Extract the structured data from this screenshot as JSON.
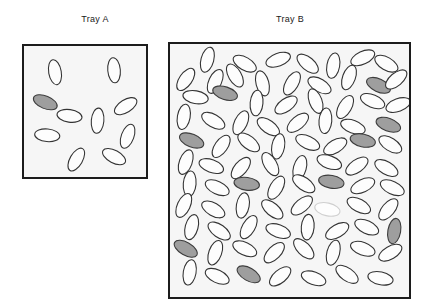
{
  "figure": {
    "type": "numerosity-comparison-stimulus",
    "background_color": "#ffffff",
    "panels": [
      {
        "id": "tray-a",
        "label": "Tray A",
        "label_position": "above-center",
        "box": {
          "x": 22,
          "y": 44,
          "width": 126,
          "height": 135
        },
        "fill_color": "#f6f6f6",
        "border_color": "#1c1c1c",
        "border_width": 2,
        "total_count": 10,
        "shaded_count": 1,
        "unshaded_count": 9,
        "shape": "ellipse"
      },
      {
        "id": "tray-b",
        "label": "Tray B",
        "label_position": "above-center",
        "box": {
          "x": 168,
          "y": 42,
          "width": 243,
          "height": 257
        },
        "fill_color": "#f6f6f6",
        "border_color": "#1c1c1c",
        "border_width": 2,
        "total_count": 85,
        "shaded_count": 10,
        "unshaded_count": 75,
        "shape": "ellipse"
      }
    ],
    "colors": {
      "shaded_fill": "#9e9e9e",
      "shaded_stroke": "#3c3c3c",
      "unshaded_fill": "#fdfdfd",
      "unshaded_stroke": "#333333",
      "faint_stroke": "#cfcfcf",
      "tray_fill": "#f6f6f6",
      "tray_border": "#1c1c1c",
      "label_text": "#1a1a1a"
    },
    "ellipse_style": {
      "rx": 13,
      "ry": 6.5,
      "stroke_width": 1.1
    }
  },
  "tray_a_ellipses": [
    {
      "cx": 32,
      "cy": 27,
      "rot": 80,
      "shade": "white"
    },
    {
      "cx": 93,
      "cy": 25,
      "rot": 85,
      "shade": "white"
    },
    {
      "cx": 22,
      "cy": 58,
      "rot": 22,
      "shade": "gray"
    },
    {
      "cx": 47,
      "cy": 72,
      "rot": 8,
      "shade": "white"
    },
    {
      "cx": 76,
      "cy": 77,
      "rot": 95,
      "shade": "white"
    },
    {
      "cx": 105,
      "cy": 62,
      "rot": 148,
      "shade": "white"
    },
    {
      "cx": 107,
      "cy": 93,
      "rot": 110,
      "shade": "white"
    },
    {
      "cx": 24,
      "cy": 92,
      "rot": 5,
      "shade": "white"
    },
    {
      "cx": 54,
      "cy": 117,
      "rot": 120,
      "shade": "white"
    },
    {
      "cx": 93,
      "cy": 114,
      "rot": 28,
      "shade": "white"
    }
  ],
  "tray_b_ellipses": [
    {
      "cx": 38,
      "cy": 16,
      "rot": 105,
      "shade": "white"
    },
    {
      "cx": 76,
      "cy": 20,
      "rot": 30,
      "shade": "white"
    },
    {
      "cx": 110,
      "cy": 16,
      "rot": 160,
      "shade": "white"
    },
    {
      "cx": 140,
      "cy": 20,
      "rot": 40,
      "shade": "white"
    },
    {
      "cx": 166,
      "cy": 22,
      "rot": 100,
      "shade": "white"
    },
    {
      "cx": 196,
      "cy": 14,
      "rot": 155,
      "shade": "white"
    },
    {
      "cx": 220,
      "cy": 20,
      "rot": 30,
      "shade": "white"
    },
    {
      "cx": 16,
      "cy": 36,
      "rot": 125,
      "shade": "white"
    },
    {
      "cx": 46,
      "cy": 38,
      "rot": 115,
      "shade": "white"
    },
    {
      "cx": 66,
      "cy": 32,
      "rot": 60,
      "shade": "white"
    },
    {
      "cx": 94,
      "cy": 40,
      "rot": 75,
      "shade": "white"
    },
    {
      "cx": 124,
      "cy": 40,
      "rot": 120,
      "shade": "white"
    },
    {
      "cx": 152,
      "cy": 42,
      "rot": 30,
      "shade": "white"
    },
    {
      "cx": 182,
      "cy": 34,
      "rot": 110,
      "shade": "white"
    },
    {
      "cx": 212,
      "cy": 42,
      "rot": 25,
      "shade": "gray"
    },
    {
      "cx": 230,
      "cy": 36,
      "rot": 140,
      "shade": "white"
    },
    {
      "cx": 26,
      "cy": 54,
      "rot": 10,
      "shade": "white"
    },
    {
      "cx": 56,
      "cy": 50,
      "rot": 18,
      "shade": "gray"
    },
    {
      "cx": 88,
      "cy": 60,
      "rot": 95,
      "shade": "white"
    },
    {
      "cx": 118,
      "cy": 62,
      "rot": 145,
      "shade": "white"
    },
    {
      "cx": 148,
      "cy": 58,
      "rot": 70,
      "shade": "white"
    },
    {
      "cx": 178,
      "cy": 64,
      "rot": 120,
      "shade": "white"
    },
    {
      "cx": 206,
      "cy": 58,
      "rot": 22,
      "shade": "white"
    },
    {
      "cx": 232,
      "cy": 62,
      "rot": 160,
      "shade": "white"
    },
    {
      "cx": 14,
      "cy": 74,
      "rot": 100,
      "shade": "white"
    },
    {
      "cx": 44,
      "cy": 78,
      "rot": 30,
      "shade": "white"
    },
    {
      "cx": 72,
      "cy": 80,
      "rot": 115,
      "shade": "white"
    },
    {
      "cx": 100,
      "cy": 84,
      "rot": 35,
      "shade": "white"
    },
    {
      "cx": 130,
      "cy": 80,
      "rot": 140,
      "shade": "white"
    },
    {
      "cx": 158,
      "cy": 78,
      "rot": 95,
      "shade": "white"
    },
    {
      "cx": 186,
      "cy": 84,
      "rot": 20,
      "shade": "white"
    },
    {
      "cx": 222,
      "cy": 82,
      "rot": 20,
      "shade": "gray"
    },
    {
      "cx": 22,
      "cy": 98,
      "rot": 22,
      "shade": "gray"
    },
    {
      "cx": 52,
      "cy": 104,
      "rot": 125,
      "shade": "white"
    },
    {
      "cx": 80,
      "cy": 100,
      "rot": 38,
      "shade": "white"
    },
    {
      "cx": 110,
      "cy": 104,
      "rot": 100,
      "shade": "white"
    },
    {
      "cx": 140,
      "cy": 100,
      "rot": 25,
      "shade": "white"
    },
    {
      "cx": 168,
      "cy": 104,
      "rot": 150,
      "shade": "white"
    },
    {
      "cx": 196,
      "cy": 98,
      "rot": 12,
      "shade": "gray"
    },
    {
      "cx": 224,
      "cy": 102,
      "rot": 32,
      "shade": "white"
    },
    {
      "cx": 16,
      "cy": 120,
      "rot": 110,
      "shade": "white"
    },
    {
      "cx": 42,
      "cy": 124,
      "rot": 20,
      "shade": "white"
    },
    {
      "cx": 72,
      "cy": 126,
      "rot": 130,
      "shade": "white"
    },
    {
      "cx": 102,
      "cy": 122,
      "rot": 60,
      "shade": "white"
    },
    {
      "cx": 132,
      "cy": 126,
      "rot": 105,
      "shade": "white"
    },
    {
      "cx": 162,
      "cy": 120,
      "rot": 20,
      "shade": "white"
    },
    {
      "cx": 190,
      "cy": 124,
      "rot": 145,
      "shade": "white"
    },
    {
      "cx": 220,
      "cy": 126,
      "rot": 30,
      "shade": "white"
    },
    {
      "cx": 20,
      "cy": 142,
      "rot": 95,
      "shade": "white"
    },
    {
      "cx": 48,
      "cy": 146,
      "rot": 25,
      "shade": "white"
    },
    {
      "cx": 78,
      "cy": 142,
      "rot": 8,
      "shade": "gray"
    },
    {
      "cx": 108,
      "cy": 146,
      "rot": 120,
      "shade": "white"
    },
    {
      "cx": 136,
      "cy": 142,
      "rot": 35,
      "shade": "white"
    },
    {
      "cx": 164,
      "cy": 140,
      "rot": 10,
      "shade": "gray"
    },
    {
      "cx": 196,
      "cy": 144,
      "rot": 155,
      "shade": "white"
    },
    {
      "cx": 226,
      "cy": 146,
      "rot": 25,
      "shade": "white"
    },
    {
      "cx": 14,
      "cy": 164,
      "rot": 115,
      "shade": "white"
    },
    {
      "cx": 44,
      "cy": 168,
      "rot": 30,
      "shade": "white"
    },
    {
      "cx": 74,
      "cy": 164,
      "rot": 100,
      "shade": "white"
    },
    {
      "cx": 104,
      "cy": 168,
      "rot": 40,
      "shade": "white"
    },
    {
      "cx": 134,
      "cy": 164,
      "rot": 140,
      "shade": "white"
    },
    {
      "cx": 160,
      "cy": 168,
      "rot": 12,
      "shade": "faint"
    },
    {
      "cx": 192,
      "cy": 164,
      "rot": 28,
      "shade": "white"
    },
    {
      "cx": 222,
      "cy": 168,
      "rot": 130,
      "shade": "white"
    },
    {
      "cx": 22,
      "cy": 186,
      "rot": 105,
      "shade": "white"
    },
    {
      "cx": 50,
      "cy": 190,
      "rot": 35,
      "shade": "white"
    },
    {
      "cx": 80,
      "cy": 186,
      "rot": 120,
      "shade": "white"
    },
    {
      "cx": 110,
      "cy": 190,
      "rot": 20,
      "shade": "white"
    },
    {
      "cx": 140,
      "cy": 186,
      "rot": 95,
      "shade": "white"
    },
    {
      "cx": 170,
      "cy": 190,
      "rot": 150,
      "shade": "white"
    },
    {
      "cx": 200,
      "cy": 186,
      "rot": 25,
      "shade": "white"
    },
    {
      "cx": 228,
      "cy": 190,
      "rot": 100,
      "shade": "gray"
    },
    {
      "cx": 16,
      "cy": 208,
      "rot": 30,
      "shade": "gray"
    },
    {
      "cx": 46,
      "cy": 212,
      "rot": 110,
      "shade": "white"
    },
    {
      "cx": 76,
      "cy": 208,
      "rot": 25,
      "shade": "white"
    },
    {
      "cx": 106,
      "cy": 212,
      "rot": 135,
      "shade": "white"
    },
    {
      "cx": 136,
      "cy": 208,
      "rot": 45,
      "shade": "white"
    },
    {
      "cx": 166,
      "cy": 212,
      "rot": 105,
      "shade": "white"
    },
    {
      "cx": 196,
      "cy": 208,
      "rot": 20,
      "shade": "white"
    },
    {
      "cx": 224,
      "cy": 212,
      "rot": 150,
      "shade": "white"
    },
    {
      "cx": 20,
      "cy": 232,
      "rot": 100,
      "shade": "white"
    },
    {
      "cx": 48,
      "cy": 236,
      "rot": 25,
      "shade": "white"
    },
    {
      "cx": 80,
      "cy": 234,
      "rot": 30,
      "shade": "gray"
    },
    {
      "cx": 112,
      "cy": 236,
      "rot": 140,
      "shade": "white"
    },
    {
      "cx": 146,
      "cy": 238,
      "rot": 20,
      "shade": "white"
    },
    {
      "cx": 180,
      "cy": 234,
      "rot": 35,
      "shade": "white"
    },
    {
      "cx": 214,
      "cy": 238,
      "rot": 12,
      "shade": "white"
    }
  ]
}
